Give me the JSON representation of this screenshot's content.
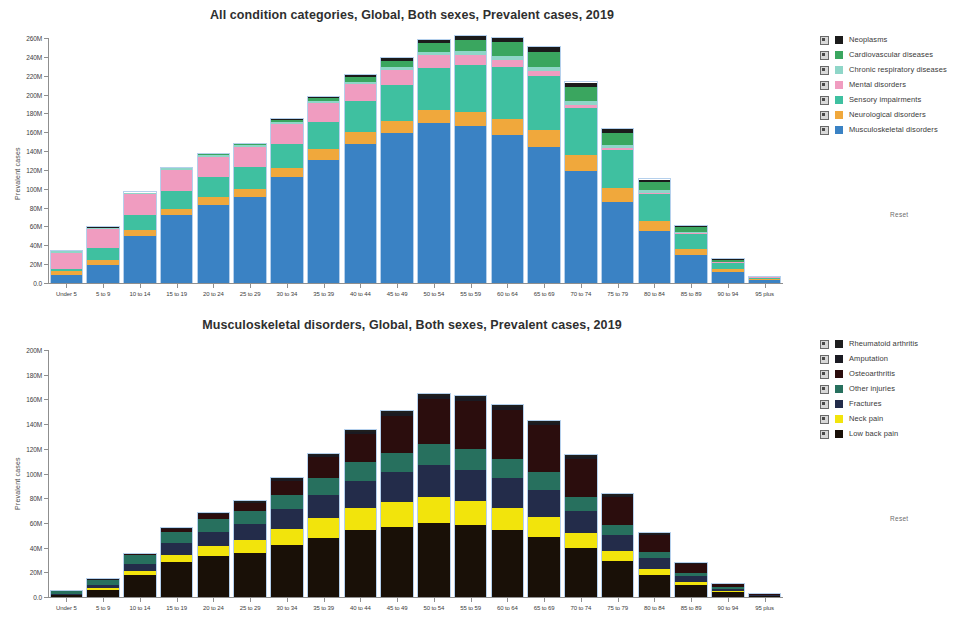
{
  "charts": [
    {
      "id": "all-conditions",
      "title": "All condition categories, Global, Both sexes, Prevalent cases, 2019",
      "ylabel": "Prevalent cases",
      "reset_label": "Reset"
    },
    {
      "id": "musculoskeletal",
      "title": "Musculoskeletal disorders, Global, Both sexes, Prevalent cases, 2019",
      "ylabel": "Prevalent cases",
      "reset_label": "Reset"
    }
  ],
  "chart_data": [
    {
      "type": "bar",
      "stacked": true,
      "title": "All condition categories, Global, Both sexes, Prevalent cases, 2019",
      "xlabel": "",
      "ylabel": "Prevalent cases",
      "ylim": [
        0,
        260000000
      ],
      "ytick_labels": [
        "0.0",
        "20M",
        "40M",
        "60M",
        "80M",
        "100M",
        "120M",
        "140M",
        "160M",
        "180M",
        "200M",
        "220M",
        "240M",
        "260M"
      ],
      "ytick_values": [
        0,
        20000000,
        40000000,
        60000000,
        80000000,
        100000000,
        120000000,
        140000000,
        160000000,
        180000000,
        200000000,
        220000000,
        240000000,
        260000000
      ],
      "grid": false,
      "legend_position": "right",
      "categories": [
        "Under 5",
        "5 to 9",
        "10 to 14",
        "15 to 19",
        "20 to 24",
        "25 to 29",
        "30 to 34",
        "35 to 39",
        "40 to 44",
        "45 to 49",
        "50 to 54",
        "55 to 59",
        "60 to 64",
        "65 to 69",
        "70 to 74",
        "75 to 79",
        "80 to 84",
        "85 to 89",
        "90 to 94",
        "95 plus"
      ],
      "series": [
        {
          "name": "Musculoskeletal disorders",
          "color": "#3a82c4",
          "values": [
            8000000,
            19000000,
            50000000,
            72000000,
            83000000,
            91000000,
            112000000,
            131000000,
            148000000,
            159000000,
            170000000,
            167000000,
            157000000,
            144000000,
            119000000,
            86000000,
            55000000,
            30000000,
            12000000,
            3000000
          ]
        },
        {
          "name": "Neurological disorders",
          "color": "#f0a83c",
          "values": [
            5000000,
            5000000,
            6000000,
            7000000,
            8000000,
            9000000,
            10000000,
            11000000,
            12000000,
            13000000,
            14000000,
            15000000,
            17000000,
            18000000,
            17000000,
            15000000,
            11000000,
            6000000,
            2500000,
            800000
          ]
        },
        {
          "name": "Sensory impairments",
          "color": "#3fc0a0",
          "values": [
            2000000,
            13000000,
            16000000,
            19000000,
            21000000,
            23000000,
            26000000,
            29000000,
            33000000,
            38000000,
            44000000,
            49000000,
            55000000,
            58000000,
            50000000,
            40000000,
            28000000,
            16000000,
            7000000,
            2000000
          ]
        },
        {
          "name": "Mental disorders",
          "color": "#f09cc0",
          "values": [
            17000000,
            20000000,
            22000000,
            22000000,
            22000000,
            21000000,
            21000000,
            20000000,
            18000000,
            16000000,
            14000000,
            11000000,
            8000000,
            5000000,
            3000000,
            2000000,
            1500000,
            900000,
            400000,
            100000
          ]
        },
        {
          "name": "Chronic respiratory diseases",
          "color": "#8fd6c8",
          "values": [
            1500000,
            1500000,
            1500000,
            1600000,
            1800000,
            2000000,
            2200000,
            2500000,
            2800000,
            3200000,
            3600000,
            4000000,
            4400000,
            4600000,
            4200000,
            3600000,
            2800000,
            1700000,
            700000,
            200000
          ]
        },
        {
          "name": "Cardiovascular diseases",
          "color": "#3aa65f",
          "values": [
            200000,
            300000,
            400000,
            600000,
            900000,
            1300000,
            2000000,
            3000000,
            4500000,
            6500000,
            9000000,
            11500000,
            14000000,
            16000000,
            15000000,
            13000000,
            9000000,
            5000000,
            2000000,
            600000
          ]
        },
        {
          "name": "Neoplasms",
          "color": "#1b1b1b",
          "values": [
            100000,
            150000,
            200000,
            300000,
            400000,
            600000,
            900000,
            1400000,
            2000000,
            2800000,
            3600000,
            4400000,
            5000000,
            5200000,
            4600000,
            3800000,
            2600000,
            1400000,
            500000,
            150000
          ]
        }
      ]
    },
    {
      "type": "bar",
      "stacked": true,
      "title": "Musculoskeletal disorders, Global, Both sexes, Prevalent cases, 2019",
      "xlabel": "",
      "ylabel": "Prevalent cases",
      "ylim": [
        0,
        200000000
      ],
      "ytick_labels": [
        "0.0",
        "20M",
        "40M",
        "60M",
        "80M",
        "100M",
        "120M",
        "140M",
        "160M",
        "180M",
        "200M"
      ],
      "ytick_values": [
        0,
        20000000,
        40000000,
        60000000,
        80000000,
        100000000,
        120000000,
        140000000,
        160000000,
        180000000,
        200000000
      ],
      "grid": false,
      "legend_position": "right",
      "categories": [
        "Under 5",
        "5 to 9",
        "10 to 14",
        "15 to 19",
        "20 to 24",
        "25 to 29",
        "30 to 34",
        "35 to 39",
        "40 to 44",
        "45 to 49",
        "50 to 54",
        "55 to 59",
        "60 to 64",
        "65 to 69",
        "70 to 74",
        "75 to 79",
        "80 to 84",
        "85 to 89",
        "90 to 94",
        "95 plus"
      ],
      "series": [
        {
          "name": "Low back pain",
          "color": "#191007",
          "values": [
            1500000,
            6000000,
            18000000,
            28000000,
            33000000,
            36000000,
            42000000,
            48000000,
            54000000,
            57000000,
            60000000,
            58000000,
            54000000,
            49000000,
            40000000,
            29000000,
            18000000,
            10000000,
            4000000,
            1000000
          ]
        },
        {
          "name": "Neck pain",
          "color": "#f2e40c",
          "values": [
            200000,
            1000000,
            3000000,
            6000000,
            8000000,
            10000000,
            13000000,
            16000000,
            18000000,
            20000000,
            21000000,
            20000000,
            18000000,
            16000000,
            12000000,
            8000000,
            5000000,
            2500000,
            900000,
            200000
          ]
        },
        {
          "name": "Fractures",
          "color": "#232c4a",
          "values": [
            800000,
            2500000,
            6000000,
            10000000,
            12000000,
            13000000,
            16000000,
            19000000,
            22000000,
            24000000,
            26000000,
            25000000,
            24000000,
            22000000,
            18000000,
            13000000,
            8500000,
            4600000,
            1800000,
            450000
          ]
        },
        {
          "name": "Other injuries",
          "color": "#27705e",
          "values": [
            2500000,
            4500000,
            7000000,
            9000000,
            10000000,
            10500000,
            12000000,
            13500000,
            15000000,
            16000000,
            17000000,
            16500000,
            15500000,
            14000000,
            11000000,
            8000000,
            5000000,
            2700000,
            1100000,
            280000
          ]
        },
        {
          "name": "Osteoarthritis",
          "color": "#2b0d0d",
          "values": [
            100000,
            200000,
            600000,
            2000000,
            4000000,
            6500000,
            11000000,
            17000000,
            23000000,
            30000000,
            36000000,
            39000000,
            40000000,
            38000000,
            31000000,
            23000000,
            14000000,
            7000000,
            2600000,
            650000
          ]
        },
        {
          "name": "Amputation",
          "color": "#1a1a22",
          "values": [
            50000,
            150000,
            300000,
            500000,
            700000,
            900000,
            1200000,
            1500000,
            1800000,
            2100000,
            2400000,
            2400000,
            2300000,
            2100000,
            1700000,
            1200000,
            750000,
            380000,
            140000,
            35000
          ]
        },
        {
          "name": "Rheumatoid arthritis",
          "color": "#1e1e1e",
          "values": [
            20000,
            60000,
            150000,
            300000,
            450000,
            600000,
            850000,
            1100000,
            1400000,
            1700000,
            1900000,
            1900000,
            1800000,
            1600000,
            1300000,
            950000,
            600000,
            300000,
            110000,
            28000
          ]
        }
      ]
    }
  ],
  "legends": [
    {
      "chart": "all-conditions",
      "reset_label": "Reset",
      "items": [
        {
          "label": "Neoplasms",
          "color": "#1b1b1b",
          "checked": true
        },
        {
          "label": "Cardiovascular diseases",
          "color": "#3aa65f",
          "checked": true
        },
        {
          "label": "Chronic respiratory diseases",
          "color": "#8fd6c8",
          "checked": true
        },
        {
          "label": "Mental disorders",
          "color": "#f09cc0",
          "checked": true
        },
        {
          "label": "Sensory impairments",
          "color": "#3fc0a0",
          "checked": true
        },
        {
          "label": "Neurological disorders",
          "color": "#f0a83c",
          "checked": true
        },
        {
          "label": "Musculoskeletal disorders",
          "color": "#3a82c4",
          "checked": true
        }
      ]
    },
    {
      "chart": "musculoskeletal",
      "reset_label": "Reset",
      "items": [
        {
          "label": "Rheumatoid arthritis",
          "color": "#1e1e1e",
          "checked": true
        },
        {
          "label": "Amputation",
          "color": "#1a1a22",
          "checked": true
        },
        {
          "label": "Osteoarthritis",
          "color": "#2b0d0d",
          "checked": true
        },
        {
          "label": "Other injuries",
          "color": "#27705e",
          "checked": true
        },
        {
          "label": "Fractures",
          "color": "#232c4a",
          "checked": true
        },
        {
          "label": "Neck pain",
          "color": "#f2e40c",
          "checked": true
        },
        {
          "label": "Low back pain",
          "color": "#191007",
          "checked": true
        }
      ]
    }
  ]
}
